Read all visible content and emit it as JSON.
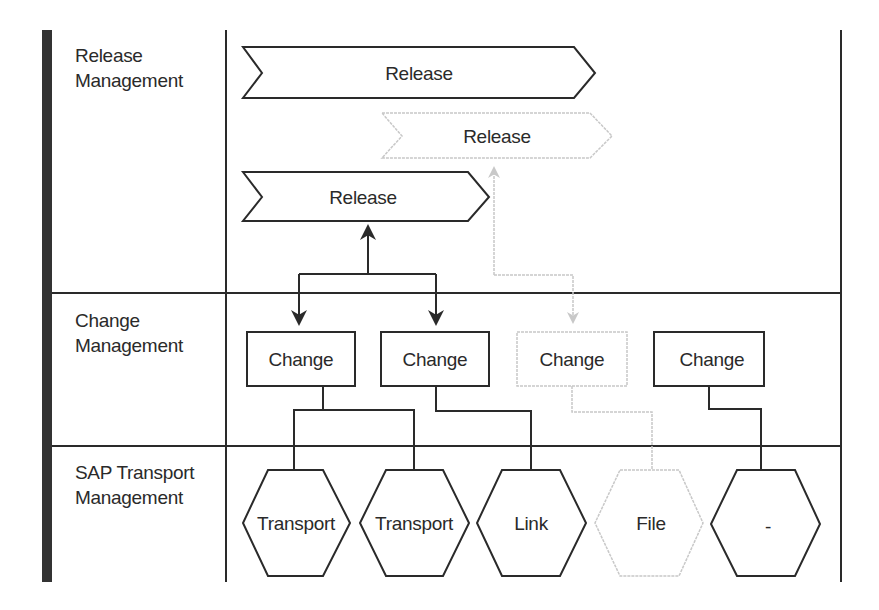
{
  "lanes": [
    {
      "label": "Release\nManagement"
    },
    {
      "label": "Change\nManagement"
    },
    {
      "label": "SAP Transport\nManagement"
    }
  ],
  "releases": [
    {
      "label": "Release",
      "state": "active"
    },
    {
      "label": "Release",
      "state": "faded"
    },
    {
      "label": "Release",
      "state": "active"
    }
  ],
  "changes": [
    {
      "label": "Change",
      "state": "active"
    },
    {
      "label": "Change",
      "state": "active"
    },
    {
      "label": "Change",
      "state": "faded"
    },
    {
      "label": "Change",
      "state": "active"
    }
  ],
  "transports": [
    {
      "label": "Transport",
      "state": "active"
    },
    {
      "label": "Transport",
      "state": "active"
    },
    {
      "label": "Link",
      "state": "active"
    },
    {
      "label": "File",
      "state": "faded"
    },
    {
      "label": "-",
      "state": "active"
    }
  ],
  "colors": {
    "stroke": "#2a2a2a",
    "faded": "#c8c8c8",
    "text": "#2a2a2a",
    "sidebar": "#333333"
  }
}
